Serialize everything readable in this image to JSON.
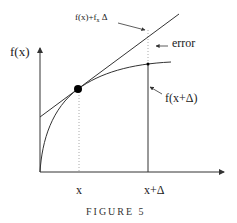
{
  "figure": {
    "caption": "FIGURE 5",
    "y_axis_label": "f(x)",
    "x_ticks": [
      {
        "label": "x"
      },
      {
        "label": "x+Δ"
      }
    ],
    "annotations": {
      "tangent_label_main": "f(x)+f",
      "tangent_label_sub": "x",
      "tangent_label_tail": " Δ",
      "error_label": "error",
      "fx_delta_label": "f(x+Δ)"
    },
    "colors": {
      "line": "#333333",
      "dotted": "#999999",
      "point": "#000000"
    }
  }
}
